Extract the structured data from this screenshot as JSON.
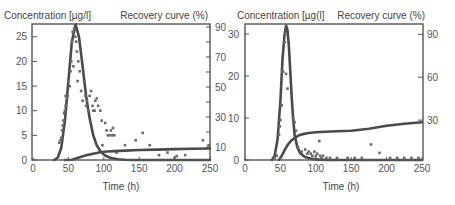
{
  "chart_data": [
    {
      "type": "line",
      "panel": "left",
      "title": "",
      "xlabel": "Time (h)",
      "ylabel_left": "Concentration [µg/l]",
      "ylabel_right": "Recovery curve (%)",
      "xlim": [
        0,
        250
      ],
      "ylim_left": [
        0,
        27.5
      ],
      "ylim_right": [
        0,
        92
      ],
      "x_ticks": [
        0,
        50,
        100,
        150,
        200,
        250
      ],
      "y_left_ticks": [
        0,
        5,
        10,
        15,
        20,
        25
      ],
      "y_right_ticks_labeled": [
        10,
        30,
        50,
        70,
        90
      ],
      "y_right_ticks_minor": [
        20,
        40,
        60,
        80
      ],
      "grid": false,
      "series": [
        {
          "name": "Concentration fit",
          "axis": "left",
          "style": "line",
          "x": [
            30,
            35,
            40,
            45,
            50,
            55,
            60,
            65,
            70,
            75,
            80,
            85,
            90,
            95,
            100,
            105,
            110,
            120,
            130,
            140,
            150,
            250
          ],
          "values": [
            0,
            0.5,
            2.5,
            8,
            16,
            24,
            27.5,
            25,
            19,
            13,
            8.5,
            5,
            3,
            1.8,
            1.1,
            0.7,
            0.4,
            0.15,
            0.05,
            0,
            0,
            0
          ]
        },
        {
          "name": "Concentration observed",
          "axis": "left",
          "style": "scatter",
          "points": [
            [
              37,
              3.5
            ],
            [
              39,
              4
            ],
            [
              40,
              4.5
            ],
            [
              41,
              6
            ],
            [
              42,
              7
            ],
            [
              43,
              8
            ],
            [
              44,
              9.5
            ],
            [
              45,
              10
            ],
            [
              46,
              11
            ],
            [
              46,
              13
            ],
            [
              48,
              12.5
            ],
            [
              49,
              13
            ],
            [
              50,
              16
            ],
            [
              52,
              15
            ],
            [
              53,
              18
            ],
            [
              54,
              20
            ],
            [
              55,
              24
            ],
            [
              56,
              26
            ],
            [
              58,
              26.5
            ],
            [
              60,
              25
            ],
            [
              61,
              24
            ],
            [
              62,
              22
            ],
            [
              64,
              20
            ],
            [
              66,
              18
            ],
            [
              57,
              19
            ],
            [
              63,
              16
            ],
            [
              68,
              14
            ],
            [
              70,
              12
            ],
            [
              72,
              16
            ],
            [
              74,
              13
            ],
            [
              75,
              11
            ],
            [
              76,
              12
            ],
            [
              78,
              10
            ],
            [
              80,
              13
            ],
            [
              82,
              14
            ],
            [
              84,
              11
            ],
            [
              85,
              10
            ],
            [
              87,
              10
            ],
            [
              88,
              12
            ],
            [
              90,
              12.5
            ],
            [
              92,
              11
            ],
            [
              95,
              10
            ],
            [
              97,
              8
            ],
            [
              98,
              3
            ],
            [
              102,
              7.5
            ],
            [
              104,
              6
            ],
            [
              106,
              5
            ],
            [
              108,
              5
            ],
            [
              110,
              6
            ],
            [
              112,
              5
            ],
            [
              113,
              6.5
            ],
            [
              115,
              5
            ],
            [
              118,
              1.5
            ],
            [
              130,
              3
            ],
            [
              145,
              4
            ],
            [
              155,
              5.5
            ],
            [
              165,
              3
            ],
            [
              178,
              1
            ],
            [
              190,
              1.5
            ],
            [
              200,
              0.5
            ],
            [
              203,
              0.8
            ],
            [
              215,
              1
            ],
            [
              240,
              4
            ],
            [
              248,
              3
            ]
          ]
        },
        {
          "name": "Recovery curve",
          "axis": "right",
          "style": "line",
          "x": [
            45,
            55,
            65,
            75,
            85,
            95,
            105,
            115,
            130,
            150,
            175,
            200,
            225,
            250
          ],
          "values": [
            0,
            1.5,
            3,
            4.5,
            5.5,
            6.5,
            7,
            7.3,
            7.6,
            8,
            8.3,
            8.6,
            8.8,
            9
          ]
        }
      ]
    },
    {
      "type": "line",
      "panel": "right",
      "title": "",
      "xlabel": "Time (h)",
      "ylabel_left": "Concentration [µg(l]",
      "ylabel_right": "Recovery curve (%)",
      "xlim": [
        0,
        250
      ],
      "ylim_left": [
        0,
        32
      ],
      "ylim_right": [
        0,
        95
      ],
      "x_ticks": [
        0,
        50,
        100,
        150,
        200,
        250
      ],
      "y_left_ticks": [
        0,
        10,
        20,
        30
      ],
      "y_right_ticks_labeled": [
        30,
        60,
        90
      ],
      "grid": false,
      "series": [
        {
          "name": "Concentration fit",
          "axis": "left",
          "style": "line",
          "x": [
            38,
            42,
            46,
            50,
            53,
            56,
            58,
            60,
            62,
            64,
            66,
            68,
            70,
            74,
            78,
            85,
            95,
            105,
            115,
            250
          ],
          "values": [
            0,
            1,
            5,
            14,
            24,
            30,
            32,
            31,
            27,
            21,
            15,
            10,
            6,
            3,
            1.6,
            0.7,
            0.25,
            0.1,
            0,
            0
          ]
        },
        {
          "name": "Concentration observed",
          "axis": "left",
          "style": "scatter",
          "points": [
            [
              42,
              0.5
            ],
            [
              45,
              1
            ],
            [
              48,
              6
            ],
            [
              49,
              8
            ],
            [
              50,
              9.5
            ],
            [
              52,
              13
            ],
            [
              53,
              21
            ],
            [
              54,
              21
            ],
            [
              56,
              28
            ],
            [
              57,
              30
            ],
            [
              58,
              20.5
            ],
            [
              60,
              17
            ],
            [
              68,
              10
            ],
            [
              70,
              9
            ],
            [
              72,
              7
            ],
            [
              75,
              3
            ],
            [
              80,
              2
            ],
            [
              85,
              2.5
            ],
            [
              88,
              1.5
            ],
            [
              90,
              2
            ],
            [
              93,
              1.5
            ],
            [
              95,
              1
            ],
            [
              98,
              2
            ],
            [
              100,
              1
            ],
            [
              102,
              1.5
            ],
            [
              105,
              4.5
            ],
            [
              106,
              1
            ],
            [
              108,
              0.5
            ],
            [
              110,
              1
            ],
            [
              115,
              0.5
            ],
            [
              120,
              0.5
            ],
            [
              130,
              0.5
            ],
            [
              145,
              0.5
            ],
            [
              155,
              0.5
            ],
            [
              165,
              0.5
            ],
            [
              178,
              3.7
            ],
            [
              190,
              1.7
            ],
            [
              205,
              0.5
            ],
            [
              215,
              0.5
            ],
            [
              225,
              0.5
            ],
            [
              235,
              0.5
            ],
            [
              245,
              0.5
            ]
          ]
        },
        {
          "name": "Recovery curve",
          "axis": "right",
          "style": "line",
          "x": [
            48,
            52,
            56,
            60,
            65,
            70,
            75,
            80,
            90,
            100,
            120,
            150,
            175,
            200,
            225,
            250
          ],
          "values": [
            0,
            5,
            9,
            12.5,
            15.5,
            17.5,
            19,
            20,
            21,
            21.5,
            22,
            22.5,
            24,
            26,
            27.5,
            28.5
          ]
        }
      ]
    }
  ],
  "panels": {
    "left": {
      "ylabel_left": "Concentration [µg/l]",
      "ylabel_right": "Recovery curve (%)",
      "xlabel": "Time (h)",
      "x_tick_labels": [
        "0",
        "50",
        "100",
        "150",
        "200",
        "250"
      ],
      "y_left_tick_labels": [
        "0",
        "5",
        "10",
        "15",
        "20",
        "25"
      ],
      "y_right_tick_labels": [
        "10",
        "30",
        "50",
        "70",
        "90"
      ]
    },
    "right": {
      "ylabel_left": "Concentration [µg(l]",
      "ylabel_right": "Recovery curve (%)",
      "xlabel": "Time (h)",
      "x_tick_labels": [
        "0",
        "50",
        "100",
        "150",
        "200",
        "250"
      ],
      "y_left_tick_labels": [
        "0",
        "10",
        "20",
        "30"
      ],
      "y_right_tick_labels": [
        "30",
        "60",
        "90"
      ]
    }
  },
  "colors": {
    "line": "#4a4a4a",
    "marker": "#6a6a6a",
    "axis": "#555555",
    "text": "#444444"
  }
}
